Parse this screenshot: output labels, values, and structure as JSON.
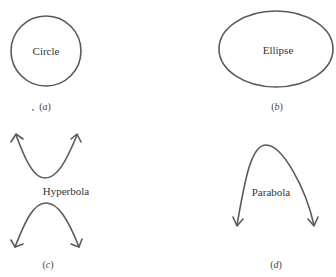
{
  "figure": {
    "panels": [
      {
        "id": "a",
        "shape": "circle",
        "label": "Circle",
        "caption_open": "(",
        "caption_letter": "a",
        "caption_close": ")"
      },
      {
        "id": "b",
        "shape": "ellipse",
        "label": "Ellipse",
        "caption_open": "(",
        "caption_letter": "b",
        "caption_close": ")"
      },
      {
        "id": "c",
        "shape": "hyperbola",
        "label": "Hyperbola",
        "caption_open": "(",
        "caption_letter": "c",
        "caption_close": ")"
      },
      {
        "id": "d",
        "shape": "parabola",
        "label": "Parabola",
        "caption_open": "(",
        "caption_letter": "d",
        "caption_close": ")"
      }
    ],
    "stroke_color": "#5a5a5a",
    "text_color": "#333333"
  }
}
